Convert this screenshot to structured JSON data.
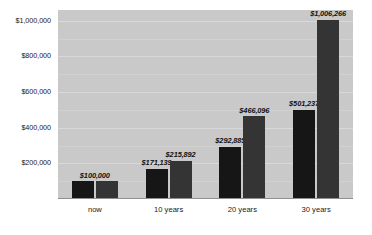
{
  "chart_data": {
    "type": "bar",
    "title": "",
    "subtitle": "",
    "xlabel": "",
    "ylabel": "",
    "grid": true,
    "legend": "none",
    "orientation": "vertical",
    "grouping": "grouped",
    "categories": [
      "now",
      "10 years",
      "20 years",
      "30 years"
    ],
    "ylim": [
      0,
      1060000
    ],
    "ytick_values": [
      200000,
      400000,
      600000,
      800000,
      1000000
    ],
    "ytick_labels": [
      "$200,000",
      "$400,000",
      "$600,000",
      "$800,000",
      "$1,000,000"
    ],
    "series": [
      {
        "name": "series-1",
        "color": "#161616",
        "values": [
          100000,
          171139,
          292885,
          501237
        ],
        "value_labels": [
          "$100,000",
          "$171,139",
          "$292,885",
          "$501,237"
        ]
      },
      {
        "name": "series-2",
        "color": "#343434",
        "values": [
          100000,
          215892,
          466096,
          1006266
        ],
        "value_labels": [
          "",
          "$215,892",
          "$466,096",
          "$1,006,266"
        ]
      }
    ],
    "annotations": [
      "The 'now' group shows a single shared label $100,000 centered over both equal-height bars."
    ]
  },
  "style": {
    "plot_background": "#c9c9c9",
    "page_background": "#ffffff",
    "gridline_color": "#d9d9d9",
    "axis_color": "#8f8f8f",
    "text_color": "#1a1a1a"
  }
}
